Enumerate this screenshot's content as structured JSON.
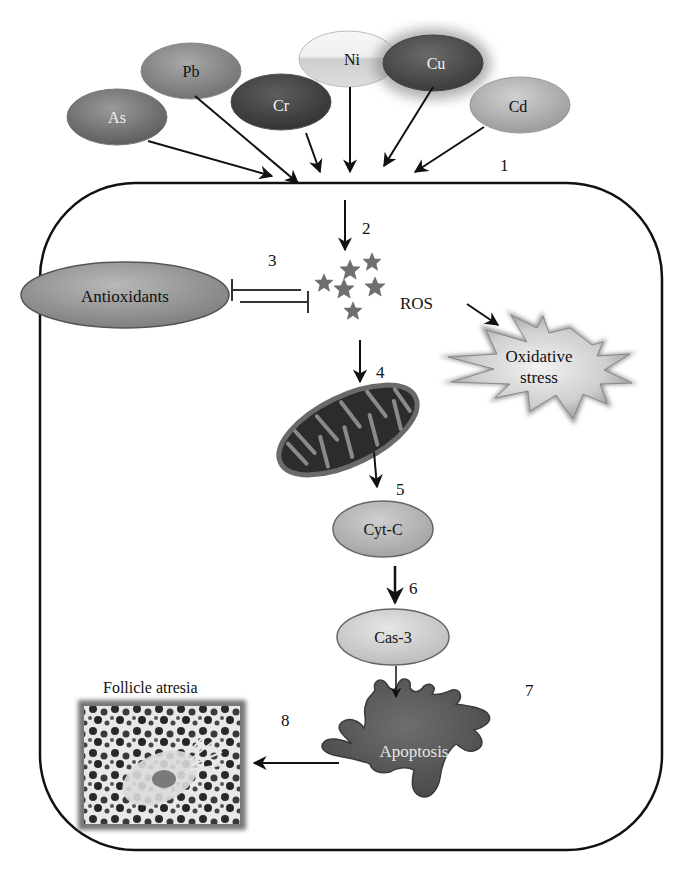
{
  "figure": {
    "metals": [
      {
        "label": "As",
        "fill": "#7a7a7a",
        "text_color": "#f2f2f2"
      },
      {
        "label": "Pb",
        "fill": "#8e8e8e",
        "text_color": "#111111"
      },
      {
        "label": "Cr",
        "fill": "#4a4a4a",
        "text_color": "#f2f2f2"
      },
      {
        "label": "Ni",
        "fill": "#e3e3e3",
        "text_color": "#111111"
      },
      {
        "label": "Cu",
        "fill": "#525252",
        "text_color": "#f2f2f2"
      },
      {
        "label": "Cd",
        "fill": "#b4b4b4",
        "text_color": "#111111"
      }
    ],
    "cell": {
      "border_color": "#111111"
    },
    "nodes": {
      "antioxidants": "Antioxidants",
      "ros": "ROS",
      "oxidative_stress_line1": "Oxidative",
      "oxidative_stress_line2": "stress",
      "cyt_c": "Cyt-C",
      "cas_3": "Cas-3",
      "apoptosis": "Apoptosis",
      "follicle_atresia": "Follicle atresia"
    },
    "step_numbers": [
      "1",
      "2",
      "3",
      "4",
      "5",
      "6",
      "7",
      "8"
    ]
  }
}
